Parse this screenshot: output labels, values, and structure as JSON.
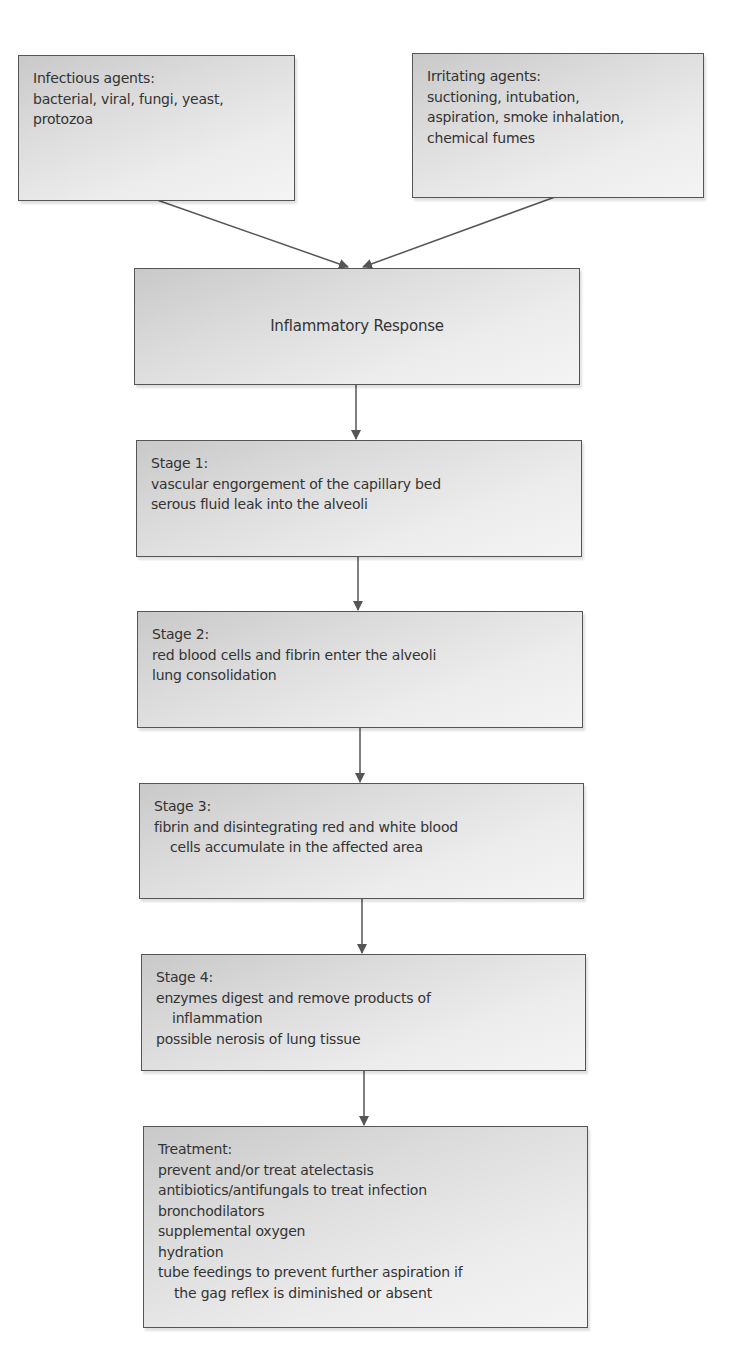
{
  "diagram": {
    "type": "flowchart",
    "stroke_color": "#555555",
    "text_color": "#333333",
    "boxes": {
      "infectious": {
        "title": "Infectious agents:",
        "lines": [
          "bacterial, viral, fungi, yeast,",
          "protozoa"
        ]
      },
      "irritating": {
        "title": "Irritating agents:",
        "lines": [
          "suctioning, intubation,",
          "aspiration, smoke inhalation,",
          "chemical fumes"
        ]
      },
      "inflammatory": {
        "title": "Inflammatory Response"
      },
      "stage1": {
        "title": "Stage 1:",
        "lines": [
          "vascular engorgement of the capillary bed",
          "serous fluid leak into the alveoli"
        ]
      },
      "stage2": {
        "title": "Stage 2:",
        "lines": [
          "red blood cells and fibrin enter the alveoli",
          "lung consolidation"
        ]
      },
      "stage3": {
        "title": "Stage 3:",
        "lines": [
          "fibrin and disintegrating red and white blood",
          "cells accumulate in the affected area"
        ]
      },
      "stage4": {
        "title": "Stage 4:",
        "lines": [
          "enzymes digest and remove products of",
          "inflammation",
          "possible nerosis of lung tissue"
        ]
      },
      "treatment": {
        "title": "Treatment:",
        "lines": [
          "prevent and/or treat atelectasis",
          "antibiotics/antifungals to treat infection",
          "bronchodilators",
          "supplemental oxygen",
          "hydration",
          "tube feedings to prevent further aspiration if",
          "the gag reflex is diminished or absent"
        ]
      }
    },
    "edges": [
      {
        "from": "infectious",
        "to": "inflammatory"
      },
      {
        "from": "irritating",
        "to": "inflammatory"
      },
      {
        "from": "inflammatory",
        "to": "stage1"
      },
      {
        "from": "stage1",
        "to": "stage2"
      },
      {
        "from": "stage2",
        "to": "stage3"
      },
      {
        "from": "stage3",
        "to": "stage4"
      },
      {
        "from": "stage4",
        "to": "treatment"
      }
    ]
  }
}
